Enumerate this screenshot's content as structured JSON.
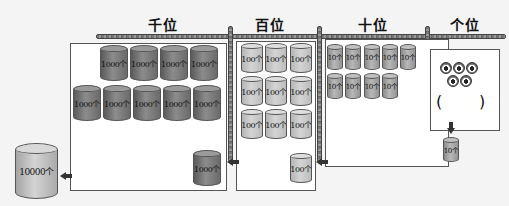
{
  "labels": {
    "thousands": "千位",
    "hundreds": "百位",
    "tens": "十位",
    "ones": "个位"
  },
  "cylinders": {
    "thousand": "1000个",
    "hundred": "100个",
    "ten": "10个",
    "ten_thousand": "10000个"
  },
  "counts": {
    "thousands_in_box": 9,
    "thousand_carry": 1,
    "hundreds_in_box": 9,
    "hundred_carry": 1,
    "tens_in_box": 9,
    "ten_carry": 1,
    "ones_balls": 5
  },
  "ones_blank": {
    "open_paren": "(",
    "close_paren": ")"
  },
  "colors": {
    "thousand_cyl": "#707070",
    "hundred_cyl": "#c8c8c8",
    "ten_cyl": "#a0a0a0",
    "ten_thousand_cyl": "#bcbcbc",
    "rod": "#888888",
    "arrow": "#333333"
  }
}
